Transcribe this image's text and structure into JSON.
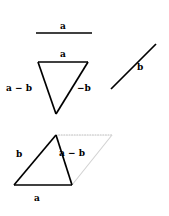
{
  "figure": {
    "background_color": "#ffffff",
    "stroke_color": "#000000",
    "construction_color": "#c9c9c9",
    "width": 169,
    "height": 216
  },
  "labels": {
    "a_top": "a",
    "a_triangle": "a",
    "a_minus_b_triangle": "a − b",
    "minus_b_triangle": "−b",
    "b_right": "b",
    "b_bottom": "b",
    "a_minus_b_bottom": "a − b",
    "a_bottom": "a"
  },
  "panels": [
    {
      "name": "vector-a-standalone",
      "description": "Horizontal vector a with arrowhead at midpoint",
      "vectors": [
        {
          "name": "a",
          "label": "a",
          "from": [
            36,
            33
          ],
          "to": [
            92,
            33
          ],
          "arrow_at": 0.55
        }
      ]
    },
    {
      "name": "subtraction-triangle",
      "description": "Triangle showing a, a minus b, and minus b",
      "vectors": [
        {
          "name": "a",
          "label": "a",
          "from": [
            38,
            62
          ],
          "to": [
            88,
            62
          ],
          "arrow_at": 0.58
        },
        {
          "name": "a-minus-b",
          "label": "a − b",
          "from": [
            38,
            62
          ],
          "to": [
            56,
            114
          ],
          "arrow_at": 0.55
        },
        {
          "name": "minus-b",
          "label": "−b",
          "from": [
            88,
            62
          ],
          "to": [
            56,
            114
          ],
          "arrow_at": 0.55
        }
      ]
    },
    {
      "name": "vector-b-standalone",
      "description": "Diagonal vector b pointing up and to the right",
      "vectors": [
        {
          "name": "b",
          "label": "b",
          "from": [
            111,
            89
          ],
          "to": [
            156,
            44
          ],
          "arrow_at": 0.58
        }
      ]
    },
    {
      "name": "parallelogram-construction",
      "description": "Triangle b, a minus b, a inside a dotted parallelogram",
      "vectors": [
        {
          "name": "b",
          "label": "b",
          "from": [
            14,
            185
          ],
          "to": [
            56,
            135
          ],
          "arrow_at": 0.55
        },
        {
          "name": "a-minus-b",
          "label": "a − b",
          "from": [
            56,
            135
          ],
          "to": [
            72,
            185
          ],
          "arrow_at": 0.52
        },
        {
          "name": "a",
          "label": "a",
          "from": [
            14,
            185
          ],
          "to": [
            72,
            185
          ],
          "arrow_at": 0.6
        }
      ],
      "construction_lines": [
        {
          "name": "dotted-top-edge",
          "from": [
            56,
            135
          ],
          "to": [
            112,
            135
          ],
          "style": "dotted"
        },
        {
          "name": "gray-right-edge",
          "from": [
            112,
            135
          ],
          "to": [
            72,
            185
          ],
          "style": "solid-gray"
        }
      ]
    }
  ]
}
